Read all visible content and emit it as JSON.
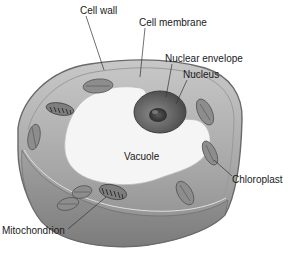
{
  "diagram": {
    "labels": [
      {
        "id": "cell-wall",
        "text": "Cell wall",
        "x": 78,
        "y": 4,
        "anchor": [
          44,
          68
        ]
      },
      {
        "id": "cell-membrane",
        "text": "Cell membrane",
        "x": 139,
        "y": 17,
        "anchor": [
          142,
          79
        ]
      },
      {
        "id": "nuclear-envelope",
        "text": "Nuclear envelope",
        "x": 165,
        "y": 53,
        "anchor": [
          167,
          97
        ]
      },
      {
        "id": "nucleus",
        "text": "Nucleus",
        "x": 183,
        "y": 69,
        "anchor": [
          176,
          104
        ]
      },
      {
        "id": "vacuole",
        "text": "Vacuole",
        "x": 124,
        "y": 151,
        "anchor": null
      },
      {
        "id": "chloroplast",
        "text": "Chloroplast",
        "x": 232,
        "y": 174,
        "anchor": [
          216,
          158
        ]
      },
      {
        "id": "mitochondrion",
        "text": "Mitochondrion",
        "x": 2,
        "y": 225,
        "anchor": [
          106,
          196
        ]
      }
    ],
    "colors": {
      "background": "#ffffff",
      "cytoplasm": "#a9a9a9",
      "cell_wall": "#8c8c8c",
      "vacuole": "#f4f4f4",
      "nucleus": "#6e6e6e",
      "nucleolus": "#3c3c3c",
      "label_text": "#1a1a1a",
      "leader_line": "#333333"
    }
  }
}
